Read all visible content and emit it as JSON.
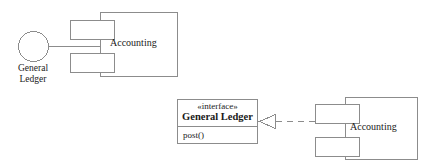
{
  "diagram": {
    "kind": "uml-component-diagram",
    "stroke_color": "#8c8c8c",
    "text_color": "#1a1a1a",
    "background": "#ffffff",
    "top_assembly": {
      "provided_interface": {
        "icon": "lollipop-circle-icon",
        "label_line1": "General",
        "label_line2": "Ledger"
      },
      "component": {
        "name": "Accounting",
        "shape": "component-rectangle-with-two-tabs"
      }
    },
    "bottom_assembly": {
      "interface_box": {
        "stereotype": "«interface»",
        "name": "General Ledger",
        "operations": [
          "post()"
        ]
      },
      "realization": {
        "line_style": "dashed",
        "arrowhead": "hollow-triangle",
        "direction": "points-left-to-interface"
      },
      "component": {
        "name": "Accounting",
        "shape": "component-rectangle-with-two-tabs"
      }
    }
  }
}
